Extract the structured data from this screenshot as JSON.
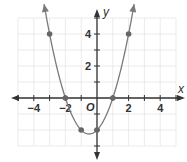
{
  "chart_data": {
    "type": "line",
    "title": "",
    "function": "y = x^2 + x - 2",
    "xlabel": "x",
    "ylabel": "y",
    "origin_label": "O",
    "xlim": [
      -5,
      5
    ],
    "ylim": [
      -3,
      5
    ],
    "grid": true,
    "x_ticks": [
      -4,
      -2,
      2,
      4
    ],
    "x_tick_labels": [
      "−4",
      "−2",
      "2",
      "4"
    ],
    "y_ticks": [
      2,
      4
    ],
    "y_tick_labels": [
      "2",
      "4"
    ],
    "series": [
      {
        "name": "parabola",
        "points": [
          {
            "x": -3,
            "y": 4
          },
          {
            "x": -2,
            "y": 0
          },
          {
            "x": -1,
            "y": -2
          },
          {
            "x": 0,
            "y": -2
          },
          {
            "x": 1,
            "y": 0
          },
          {
            "x": 2,
            "y": 4
          }
        ],
        "vertex": {
          "x": -0.5,
          "y": -2.25
        },
        "color": "#7a7a7a"
      }
    ]
  },
  "colors": {
    "axis": "#333333",
    "grid": "#e6e6e6",
    "curve": "#7a7a7a",
    "point": "#666666"
  }
}
